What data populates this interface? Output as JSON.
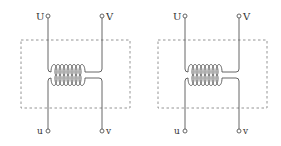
{
  "diagram": {
    "type": "transformer-schematic",
    "line_color": "#555555",
    "box_color": "#888888",
    "transformers": [
      {
        "id": "left",
        "primary_terminals": [
          "U",
          "V"
        ],
        "secondary_terminals": [
          "u",
          "v"
        ],
        "coil_turns_primary": 8,
        "coil_turns_secondary": 8
      },
      {
        "id": "right",
        "primary_terminals": [
          "U",
          "V"
        ],
        "secondary_terminals": [
          "u",
          "v"
        ],
        "coil_turns_primary": 8,
        "coil_turns_secondary": 8
      }
    ]
  },
  "labels": {
    "t1": {
      "U": "U",
      "V": "V",
      "u": "u",
      "v": "v"
    },
    "t2": {
      "U": "U",
      "V": "V",
      "u": "u",
      "v": "v"
    }
  }
}
